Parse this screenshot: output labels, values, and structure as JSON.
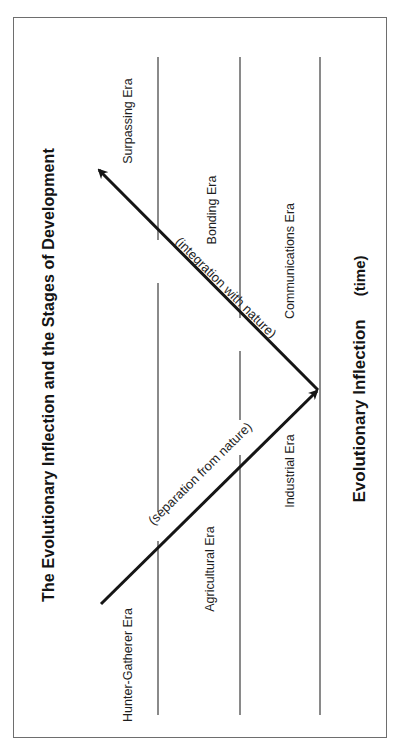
{
  "diagram": {
    "title": "The Evolutionary Inflection and the Stages of Development",
    "axis": {
      "label": "Evolutionary Inflection",
      "unit": "(time)"
    },
    "eras": [
      {
        "name": "Hunter-Gatherer Era",
        "column": 1,
        "side": "lower"
      },
      {
        "name": "Agricultural Era",
        "column": 2,
        "side": "lower"
      },
      {
        "name": "Industrial Era",
        "column": 3,
        "side": "lower"
      },
      {
        "name": "Communications Era",
        "column": 3,
        "side": "upper"
      },
      {
        "name": "Bonding Era",
        "column": 2,
        "side": "upper"
      },
      {
        "name": "Surpassing Era",
        "column": 1,
        "side": "upper"
      }
    ],
    "arrows": [
      {
        "label": "(separation from nature)",
        "direction": "toward inflection point"
      },
      {
        "label": "(integration with nature)",
        "direction": "away from inflection point"
      }
    ],
    "colors": {
      "arrow": "#151515",
      "divider": "#8a8a8a",
      "frame": "#6e6e6e",
      "text": "#1a1a1a"
    }
  }
}
